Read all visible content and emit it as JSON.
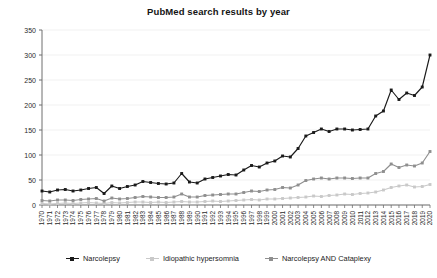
{
  "chart_data": {
    "type": "line",
    "title": "PubMed search results by year",
    "xlabel": "",
    "ylabel": "",
    "ylim": [
      0,
      350
    ],
    "yticks": [
      0,
      50,
      100,
      150,
      200,
      250,
      300,
      350
    ],
    "grid": true,
    "legend_position": "bottom",
    "x": [
      1970,
      1971,
      1972,
      1973,
      1974,
      1975,
      1976,
      1977,
      1978,
      1979,
      1980,
      1981,
      1982,
      1983,
      1984,
      1985,
      1986,
      1987,
      1988,
      1989,
      1990,
      1991,
      1992,
      1993,
      1994,
      1995,
      1996,
      1997,
      1998,
      1999,
      2000,
      2001,
      2002,
      2003,
      2004,
      2005,
      2006,
      2007,
      2008,
      2009,
      2010,
      2011,
      2012,
      2013,
      2014,
      2015,
      2016,
      2017,
      2018,
      2019,
      2020
    ],
    "categories": [
      "1970",
      "1971",
      "1972",
      "1973",
      "1974",
      "1975",
      "1976",
      "1977",
      "1978",
      "1979",
      "1980",
      "1981",
      "1982",
      "1983",
      "1984",
      "1985",
      "1986",
      "1987",
      "1988",
      "1989",
      "1990",
      "1991",
      "1992",
      "1993",
      "1994",
      "1995",
      "1996",
      "1997",
      "1998",
      "1999",
      "2000",
      "2001",
      "2002",
      "2003",
      "2004",
      "2005",
      "2006",
      "2007",
      "2008",
      "2009",
      "2010",
      "2011",
      "2012",
      "2013",
      "2014",
      "2015",
      "2016",
      "2017",
      "2018",
      "2019",
      "2020"
    ],
    "series": [
      {
        "name": "Narcolepsy",
        "color": "#1a1a1a",
        "marker": "square",
        "values": [
          28,
          26,
          30,
          31,
          28,
          30,
          33,
          35,
          23,
          38,
          33,
          37,
          40,
          47,
          45,
          43,
          42,
          44,
          63,
          46,
          44,
          52,
          55,
          58,
          61,
          60,
          70,
          79,
          76,
          84,
          88,
          98,
          96,
          113,
          138,
          145,
          152,
          147,
          152,
          152,
          150,
          151,
          152,
          178,
          188,
          230,
          211,
          224,
          219,
          236,
          300
        ]
      },
      {
        "name": "Idiopathic hypersomnia",
        "color": "#c9c9c9",
        "marker": "square",
        "values": [
          3,
          2,
          3,
          4,
          3,
          4,
          5,
          4,
          3,
          5,
          4,
          5,
          6,
          6,
          5,
          6,
          5,
          6,
          7,
          6,
          6,
          7,
          8,
          7,
          8,
          9,
          10,
          11,
          10,
          12,
          12,
          13,
          14,
          15,
          16,
          18,
          17,
          19,
          20,
          22,
          21,
          23,
          24,
          26,
          30,
          35,
          38,
          40,
          36,
          37,
          41
        ]
      },
      {
        "name": "Narcolepsy AND Cataplexy",
        "color": "#8f8f8f",
        "marker": "square",
        "values": [
          9,
          8,
          10,
          10,
          9,
          11,
          12,
          13,
          8,
          14,
          12,
          13,
          15,
          17,
          16,
          15,
          15,
          16,
          22,
          16,
          16,
          19,
          20,
          21,
          22,
          22,
          25,
          28,
          27,
          30,
          31,
          35,
          34,
          40,
          49,
          52,
          54,
          52,
          54,
          54,
          53,
          54,
          54,
          63,
          67,
          82,
          75,
          80,
          78,
          84,
          107
        ]
      }
    ],
    "series_tail_note": ""
  },
  "legend": {
    "entries": [
      {
        "label": "Narcolepsy"
      },
      {
        "label": "Idiopathic hypersomnia"
      },
      {
        "label": "Narcolepsy AND Cataplexy"
      }
    ]
  }
}
